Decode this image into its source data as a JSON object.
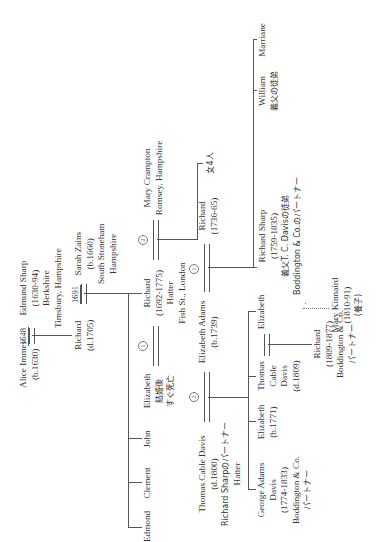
{
  "diagram": {
    "type": "family-tree",
    "orientation": "rotated-90-ccw",
    "people": {
      "alice_immes": {
        "name": "Alice Immes",
        "dates": "(b.1630)"
      },
      "edmund_sharp": {
        "name": "Edmund Sharp",
        "dates": "(1630-94)",
        "place1": "Berkshire",
        "place2": "Timsbury, Hampshire"
      },
      "marriage_1648": {
        "year": "1648"
      },
      "richard_1705": {
        "name": "Richard",
        "dates": "(d.1705)"
      },
      "marriage_1691": {
        "year": "1691"
      },
      "sarah_zains": {
        "name": "Sarah Zains",
        "dates": "(b.1660)",
        "place1": "South Stoneham",
        "place2": "Hampshire"
      },
      "edmond": {
        "name": "Edmond"
      },
      "clement": {
        "name": "Clement"
      },
      "john": {
        "name": "John"
      },
      "elizabeth_1": {
        "name": "Elizabeth",
        "note1": "結婚後",
        "note2": "すぐ死亡"
      },
      "circle_1a": {
        "label": "1"
      },
      "richard_1692": {
        "name": "Richard",
        "dates": "(1692-1775)",
        "occupation": "Hatter",
        "place": "Fish St., London"
      },
      "circle_2a": {
        "label": "2"
      },
      "mary_crampton": {
        "name": "Mary Crampton",
        "place": "Romsey, Hampshire"
      },
      "thomas_cable_davis_1800": {
        "name": "Thomas Cable Davis",
        "dates": "(d.1800)",
        "note": "Richard Sharpのパートナー",
        "occupation": "Hatter"
      },
      "circle_2b": {
        "label": "2"
      },
      "elizabeth_adams": {
        "name": "Elizabeth Adams",
        "dates": "(b.1739)"
      },
      "circle_1b": {
        "label": "1"
      },
      "richard_1736": {
        "name": "Richard",
        "dates": "(1736-65)"
      },
      "daughters_4": {
        "name": "女4人"
      },
      "george_adams_davis": {
        "name": "George Adams",
        "name2": "Davis",
        "dates": "(1774-1833)",
        "firm": "Boddington & Co.",
        "note": "パートナー"
      },
      "elizabeth_1771": {
        "name": "Elizabeth",
        "dates": "(b.1771)"
      },
      "thomas_cable_davis_1809": {
        "name": "Thomas",
        "name2": "Cable",
        "name3": "Davis",
        "dates": "(d.1809)"
      },
      "elizabeth_3": {
        "name": "Elizabeth"
      },
      "richard_1809": {
        "name": "Richard",
        "dates": "(1809-1877)",
        "firm": "Boddington & Co.",
        "note": "パートナー"
      },
      "richard_sharp": {
        "name": "Richard Sharp",
        "dates": "(1759-1835)",
        "note1": "義父T. C. Davisの徒弟",
        "note2": "Boddington & Co.のパートナー"
      },
      "mary_kinnaird": {
        "name": "Mary Kinnaird",
        "dates": "(1810-91)",
        "note": "(養子)"
      },
      "william": {
        "name": "William",
        "note": "義父の徒弟"
      },
      "marriane": {
        "name": "Marriane"
      }
    }
  }
}
